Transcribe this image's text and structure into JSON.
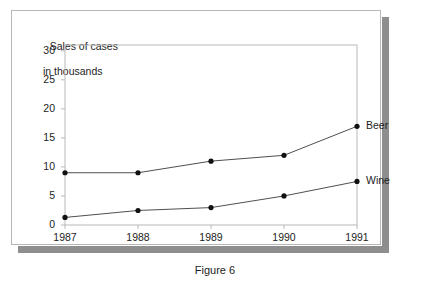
{
  "figure": {
    "caption": "Figure 6"
  },
  "chart_data": {
    "type": "line",
    "title": "Sales of cases\nin thousands",
    "title_line1": "Sales of cases",
    "title_line2": "in thousands",
    "xlabel": "",
    "ylabel": "Sales of cases in thousands",
    "categories": [
      "1987",
      "1988",
      "1989",
      "1990",
      "1991"
    ],
    "x": [
      1987,
      1988,
      1989,
      1990,
      1991
    ],
    "xlim": [
      1987,
      1991
    ],
    "ylim": [
      0,
      31
    ],
    "yticks": [
      0,
      5,
      10,
      15,
      20,
      25,
      30
    ],
    "ytick_labels": [
      "0",
      "5",
      "10",
      "15",
      "20",
      "25",
      "30"
    ],
    "xtick_labels": [
      "1987",
      "1988",
      "1989",
      "1990",
      "1991"
    ],
    "grid": false,
    "legend_position": "inline-right",
    "marker": "filled-circle",
    "line_color": "#4f4f4f",
    "marker_color": "#111111",
    "axis_color": "#b9b9b9",
    "series": [
      {
        "name": "Beer",
        "values": [
          9,
          9,
          11,
          12,
          17
        ]
      },
      {
        "name": "Wine",
        "values": [
          1.3,
          2.5,
          3,
          5,
          7.5
        ]
      }
    ]
  }
}
